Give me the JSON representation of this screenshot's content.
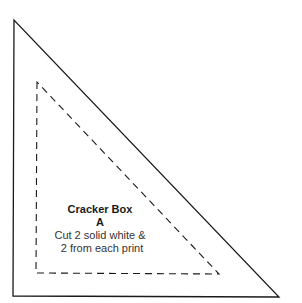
{
  "pattern": {
    "title": "Cracker Box",
    "piece": "A",
    "instructions": [
      "Cut 2 solid white &",
      "2 from each print"
    ]
  },
  "shapes": {
    "outer_triangle": {
      "style": "solid",
      "points": [
        [
          14,
          20
        ],
        [
          13,
          296
        ],
        [
          279,
          297
        ]
      ],
      "stroke": "#1a1a1a"
    },
    "inner_triangle": {
      "style": "dashed",
      "points": [
        [
          37,
          82
        ],
        [
          36,
          273
        ],
        [
          219,
          274
        ]
      ],
      "stroke": "#1a1a1a"
    }
  },
  "colors": {
    "background": "#ffffff",
    "line": "#1a1a1a"
  }
}
